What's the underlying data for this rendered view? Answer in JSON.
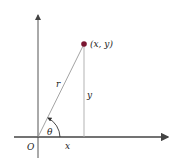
{
  "diagram": {
    "point_label": "(x, y)",
    "radius_label": "r",
    "vertical_label": "y",
    "horizontal_label": "x",
    "angle_label": "θ",
    "origin_label": "O",
    "colors": {
      "axis": "#444444",
      "line": "#888888",
      "point": "#7a1530",
      "text": "#222222"
    }
  }
}
